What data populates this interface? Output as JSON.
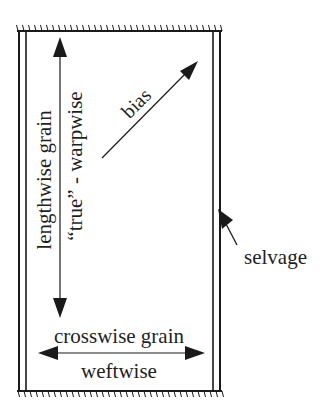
{
  "diagram": {
    "labels": {
      "lengthwise": "lengthwise grain",
      "warpwise": "“true” - warpwise",
      "bias": "bias",
      "selvage": "selvage",
      "crosswise": "crosswise grain",
      "weftwise": "weftwise"
    },
    "colors": {
      "line": "#1a1a1a",
      "background": "#ffffff"
    }
  }
}
